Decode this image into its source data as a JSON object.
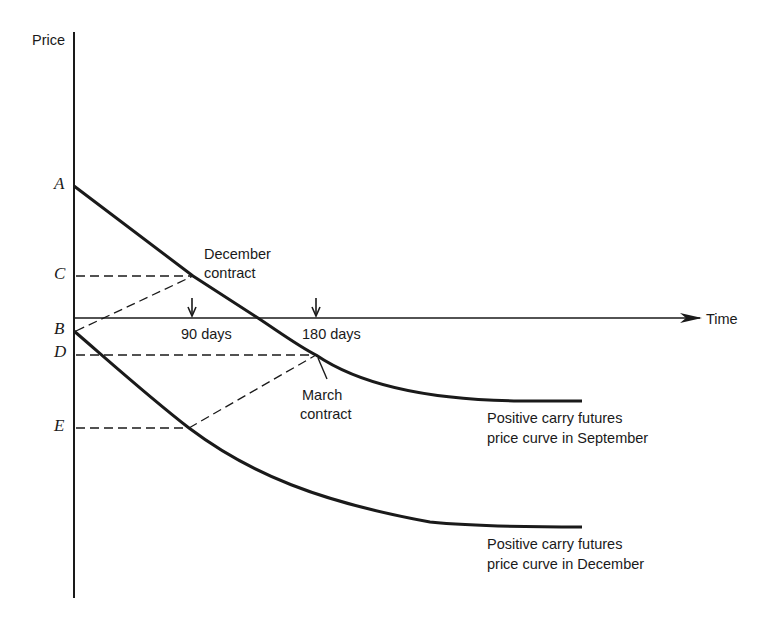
{
  "diagram": {
    "y_axis_label": "Price",
    "x_axis_label": "Time",
    "price_levels": [
      "A",
      "C",
      "B",
      "D",
      "E"
    ],
    "time_markers": [
      {
        "label": "90 days"
      },
      {
        "label": "180 days"
      }
    ],
    "annotations": {
      "december_contract": [
        "December",
        "contract"
      ],
      "march_contract": [
        "March",
        "contract"
      ]
    },
    "curves": [
      {
        "name": "september",
        "label_line1": "Positive carry futures",
        "label_line2": "price curve in September"
      },
      {
        "name": "december",
        "label_line1": "Positive carry futures",
        "label_line2": "price curve in December"
      }
    ],
    "colors": {
      "ink": "#1a1a1a",
      "background": "#ffffff"
    }
  }
}
